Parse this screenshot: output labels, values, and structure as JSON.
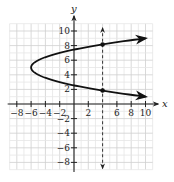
{
  "chart_data": {
    "type": "line",
    "title": "",
    "xlabel": "x",
    "ylabel": "y",
    "xlim": [
      -9,
      11
    ],
    "ylim": [
      -9,
      11
    ],
    "grid": true,
    "x_ticks": [
      -8,
      -6,
      -4,
      -2,
      2,
      6,
      8,
      10
    ],
    "x_tick_labels": [
      "−8",
      "−6",
      "−4",
      "−2",
      "2",
      "6",
      "8",
      "10"
    ],
    "y_ticks": [
      -8,
      -6,
      -4,
      -2,
      2,
      4,
      6,
      8,
      10
    ],
    "y_tick_labels": [
      "−8",
      "−6",
      "−4",
      "−2",
      "2",
      "4",
      "6",
      "8",
      "10"
    ],
    "series": [
      {
        "name": "parabola",
        "equation": "x = (y - 5)^2 - 6",
        "vertex": [
          -6,
          5
        ],
        "y_range": [
          1,
          9
        ],
        "color": "#111111",
        "arrows": "both-ends"
      },
      {
        "name": "vertical-line-test",
        "equation": "x = 4",
        "style": "dashed",
        "y_range": [
          -8.8,
          10.4
        ],
        "color": "#333333",
        "arrows": "both-ends"
      }
    ],
    "points": [
      {
        "x": 4,
        "y": 8.16
      },
      {
        "x": 4,
        "y": 1.84
      }
    ]
  },
  "colors": {
    "grid_minor": "#e6e6e6",
    "grid_major": "#cfcfcf",
    "axis": "#222222",
    "curve": "#111111"
  }
}
